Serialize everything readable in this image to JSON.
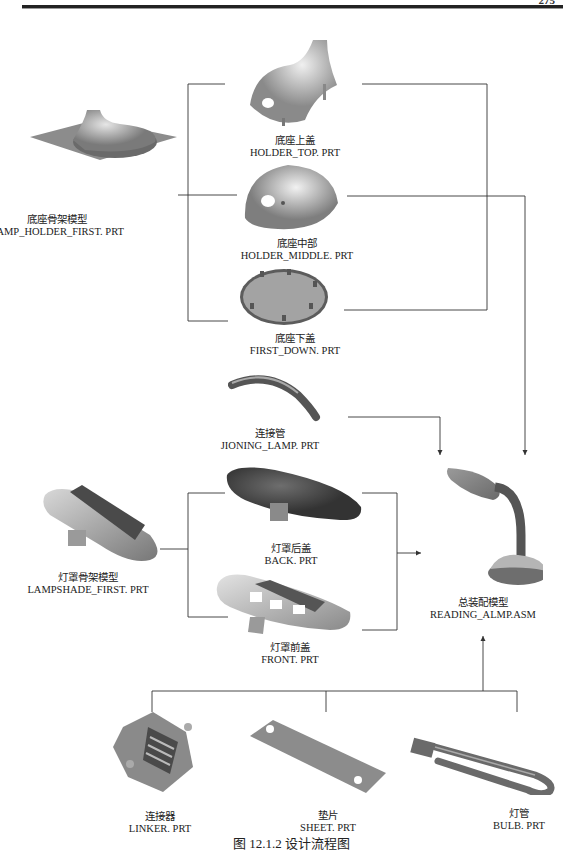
{
  "header": {
    "chapter_text": "",
    "page_number": "275"
  },
  "parts": {
    "lamp_holder_first": {
      "cn": "底座骨架模型",
      "en": "LAMP_HOLDER_FIRST. PRT"
    },
    "holder_top": {
      "cn": "底座上盖",
      "en": "HOLDER_TOP. PRT"
    },
    "holder_middle": {
      "cn": "底座中部",
      "en": "HOLDER_MIDDLE. PRT"
    },
    "first_down": {
      "cn": "底座下盖",
      "en": "FIRST_DOWN. PRT"
    },
    "jioning_lamp": {
      "cn": "连接管",
      "en": "JIONING_LAMP. PRT"
    },
    "lampshade_first": {
      "cn": "灯罩骨架模型",
      "en": "LAMPSHADE_FIRST. PRT"
    },
    "back": {
      "cn": "灯罩后盖",
      "en": "BACK. PRT"
    },
    "front": {
      "cn": "灯罩前盖",
      "en": "FRONT. PRT"
    },
    "assembly": {
      "cn": "总装配模型",
      "en": "READING_ALMP.ASM"
    },
    "linker": {
      "cn": "连接器",
      "en": "LINKER. PRT"
    },
    "sheet": {
      "cn": "垫片",
      "en": "SHEET. PRT"
    },
    "bulb": {
      "cn": "灯管",
      "en": "BULB. PRT"
    }
  },
  "caption": "图 12.1.2    设计流程图",
  "colors": {
    "line": "#333333",
    "part_light": "#cfcfcf",
    "part_dark": "#6e6e6e",
    "assembly_accent": "#8a8a8a"
  }
}
